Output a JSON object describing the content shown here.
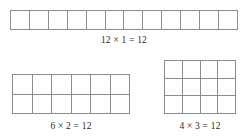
{
  "figure": {
    "total": 12,
    "line_color": "#8c8c8c",
    "text_color": "#1f1f1f",
    "background_color": "#ffffff"
  },
  "arrays": [
    {
      "id": "12x1",
      "columns": 12,
      "rows": 1,
      "cells": 12,
      "caption": "12 × 1 = 12",
      "factor_a": 12,
      "factor_b": 1,
      "product": 12
    },
    {
      "id": "6x2",
      "columns": 6,
      "rows": 2,
      "cells": 12,
      "caption": "6 × 2 = 12",
      "factor_a": 6,
      "factor_b": 2,
      "product": 12
    },
    {
      "id": "4x3",
      "columns": 4,
      "rows": 3,
      "cells": 12,
      "caption": "4 × 3 = 12",
      "factor_a": 4,
      "factor_b": 3,
      "product": 12
    }
  ]
}
